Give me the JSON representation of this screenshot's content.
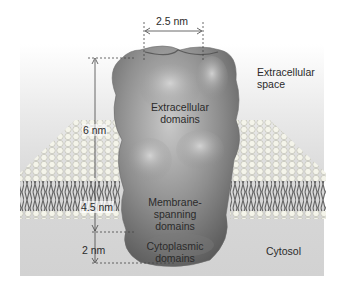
{
  "figure": {
    "regions": {
      "extracellular": "Extracellular\nspace",
      "cytosol": "Cytosol"
    },
    "domains": {
      "extracellular": "Extracellular\ndomains",
      "membrane": "Membrane-\nspanning\ndomains",
      "cytoplasmic": "Cytoplasmic\ndomains"
    },
    "measurements": {
      "width": "2.5 nm",
      "extracellular_height": "6 nm",
      "membrane_thickness": "4.5 nm",
      "cytoplasmic_height": "2 nm"
    },
    "colors": {
      "protein": "#8a8a8a",
      "lipid_head": "#f2f2e6",
      "lipid_tail": "#6a6a6a",
      "backdrop": "#d8d8d8",
      "text": "#2b2b2b"
    }
  }
}
